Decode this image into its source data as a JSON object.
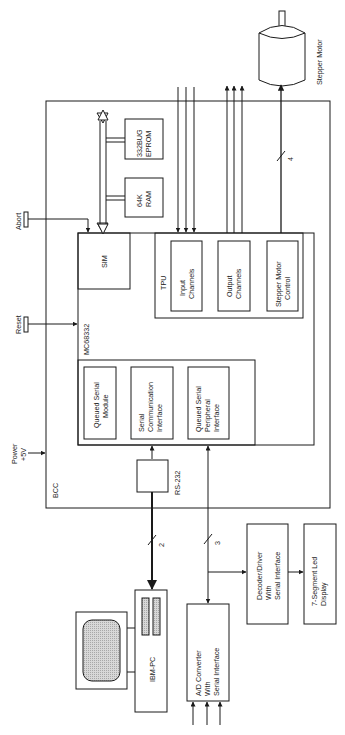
{
  "diagram": {
    "orientation": "rotated-90-ccw",
    "colors": {
      "line": "#1a1a1a",
      "background": "#ffffff",
      "screen_fill": "#cfcfcf"
    },
    "blocks": {
      "bcc": {
        "label": "BCC"
      },
      "mc68332": {
        "label": "MC68332"
      },
      "sim": {
        "label": "SIM"
      },
      "tpu": {
        "label": "TPU"
      },
      "input_channels": {
        "line1": "Input",
        "line2": "Channels"
      },
      "output_channels": {
        "line1": "Output",
        "line2": "Channels"
      },
      "stepper_control": {
        "line1": "Stepper Motor",
        "line2": "Control"
      },
      "qsm": {
        "line1": "Queued Serial",
        "line2": "Module"
      },
      "sci": {
        "line1": "Serial",
        "line2": "Communication",
        "line3": "Interface"
      },
      "qspi": {
        "line1": "Queued Serial",
        "line2": "Peripheral",
        "line3": "Interface"
      },
      "ram": {
        "line1": "64K",
        "line2": "RAM"
      },
      "eprom": {
        "line1": "332BUG",
        "line2": "EPROM"
      },
      "rs232": {
        "label": "RS-232"
      },
      "ibm_pc": {
        "label": "IBM-PC"
      },
      "adc": {
        "line1": "A/D Converter",
        "line2": "With",
        "line3": "Serial Interface"
      },
      "decoder": {
        "line1": "Decoder/Driver",
        "line2": "With",
        "line3": "Serial Interface"
      },
      "led_display": {
        "line1": "7-Segment Led",
        "line2": "Display"
      },
      "stepper_motor": {
        "label": "Stepper Motor"
      }
    },
    "signals": {
      "abort": "Abort",
      "reset": "Reset",
      "power_line1": "Power",
      "power_line2": "+5V"
    },
    "bus_widths": {
      "rs232_to_pc": "2",
      "qspi_bus": "3",
      "stepper_bus": "4"
    }
  }
}
